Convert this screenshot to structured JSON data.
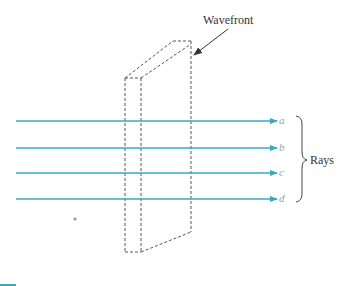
{
  "diagram": {
    "wavefront_label": "Wavefront",
    "rays_label": "Rays",
    "ray_color": "#3aaabb",
    "rays": [
      {
        "label": "a",
        "y": 121
      },
      {
        "label": "b",
        "y": 148
      },
      {
        "label": "c",
        "y": 173
      },
      {
        "label": "d",
        "y": 199
      }
    ]
  }
}
